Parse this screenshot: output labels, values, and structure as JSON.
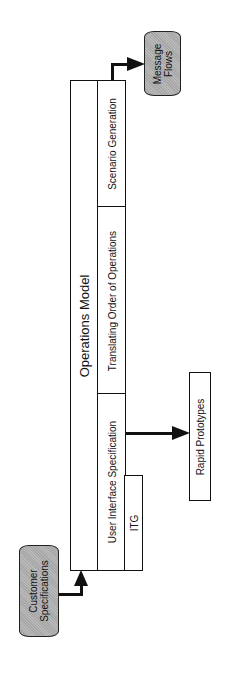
{
  "diagram": {
    "orientation": "rotated-90-ccw",
    "main_block": {
      "title": "Operations Model",
      "sections": [
        {
          "id": "scenario",
          "label": "Scenario Generation"
        },
        {
          "id": "translating",
          "label": "Translating Order of Operations"
        },
        {
          "id": "user-interface",
          "label": "User Interface Specification"
        }
      ],
      "sub_block": {
        "label": "ITG"
      }
    },
    "inputs": [
      {
        "label_line1": "Customer",
        "label_line2": "Specifications",
        "shape": "terminator",
        "fill": "#b9b9b9"
      }
    ],
    "outputs": [
      {
        "label_line1": "Message",
        "label_line2": "Flows",
        "shape": "terminator",
        "fill": "#b9b9b9",
        "from": "Scenario Generation"
      },
      {
        "label": "Rapid Prototypes",
        "shape": "rectangle",
        "from": "User Interface Specification"
      }
    ],
    "colors": {
      "line": "#111111",
      "terminator_fill": "#b9b9b9",
      "background": "#ffffff"
    }
  }
}
